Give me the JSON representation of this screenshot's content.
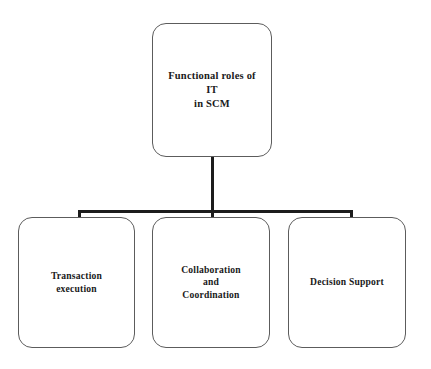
{
  "diagram": {
    "type": "hierarchy-tree",
    "background_color": "#ffffff",
    "box_border_color": "#5c5c5c",
    "connector_color": "#1c1c1c",
    "text_color": "#1a1a1a",
    "root": {
      "label": "Functional roles of IT\nin SCM"
    },
    "children": [
      {
        "label": "Transaction\nexecution"
      },
      {
        "label": "Collaboration\nand\nCoordination"
      },
      {
        "label": "Decision Support"
      }
    ]
  }
}
